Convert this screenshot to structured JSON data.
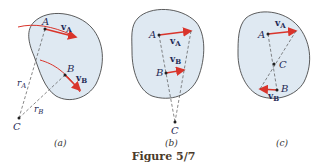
{
  "figure": {
    "title": "Figure 5/7",
    "colors": {
      "body_fill": "#dfe9f2",
      "body_stroke": "#333333",
      "vector": "#d9342b",
      "path": "#d9342b",
      "label": "#1f2a55",
      "dashed": "#555555"
    },
    "panels": [
      {
        "caption": "(a)",
        "points": [
          "A",
          "B",
          "C"
        ],
        "vectors": [
          "v_A",
          "v_B"
        ],
        "radii": [
          "r_A",
          "r_B"
        ],
        "labels": {
          "A": "A",
          "B": "B",
          "C": "C",
          "vA": "v",
          "vA_sub": "A",
          "vB": "v",
          "vB_sub": "B",
          "rA": "r",
          "rA_sub": "A",
          "rB": "r",
          "rB_sub": "B"
        }
      },
      {
        "caption": "(b)",
        "points": [
          "A",
          "B",
          "C"
        ],
        "vectors": [
          "v_A",
          "v_B"
        ],
        "labels": {
          "A": "A",
          "B": "B",
          "C": "C",
          "vA": "v",
          "vA_sub": "A",
          "vB": "v",
          "vB_sub": "B"
        }
      },
      {
        "caption": "(c)",
        "points": [
          "A",
          "B",
          "C"
        ],
        "vectors": [
          "v_A",
          "v_B"
        ],
        "labels": {
          "A": "A",
          "B": "B",
          "C": "C",
          "vA": "v",
          "vA_sub": "A",
          "vB": "v",
          "vB_sub": "B"
        }
      }
    ]
  }
}
